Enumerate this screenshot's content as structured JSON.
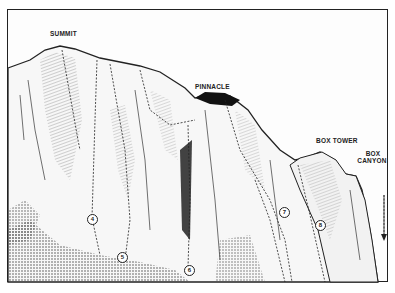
{
  "labels": {
    "summit": "SUMMIT",
    "pinnacle": "PINNACLE",
    "box_tower": "BOX TOWER",
    "box_canyon_1": "BOX",
    "box_canyon_2": "CANYON"
  },
  "routes": [
    {
      "id": "4",
      "label": "4"
    },
    {
      "id": "5",
      "label": "5"
    },
    {
      "id": "6",
      "label": "6"
    },
    {
      "id": "7",
      "label": "7"
    },
    {
      "id": "8",
      "label": "8"
    }
  ],
  "colors": {
    "ink": "#222222",
    "paper": "#fdfdfd"
  }
}
